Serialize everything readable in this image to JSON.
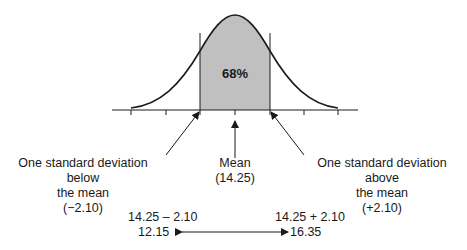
{
  "diagram": {
    "type": "normal-distribution",
    "shaded_percent_label": "68%",
    "colors": {
      "shade": "#c0c0c0",
      "line": "#1a1a1a"
    },
    "labels": {
      "below": {
        "lines": [
          "One standard deviation below",
          "the mean",
          "(−2.10)"
        ]
      },
      "mean": {
        "lines": [
          "Mean",
          "(14.25)"
        ]
      },
      "above": {
        "lines": [
          "One standard deviation above",
          "the mean",
          "(+2.10)"
        ]
      }
    },
    "range": {
      "lower_expr": "14.25 – 2.10",
      "lower_value": "12.15",
      "upper_expr": "14.25 + 2.10",
      "upper_value": "16.35"
    }
  }
}
